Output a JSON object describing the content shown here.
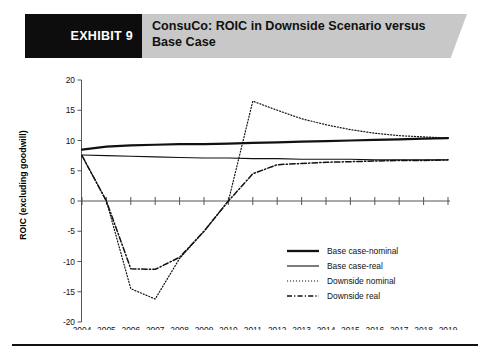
{
  "header": {
    "exhibit_label": "EXHIBIT 9",
    "title": "ConsuCo: ROIC in Downside Scenario versus Base Case",
    "banner_color": "#c8c8c8",
    "block_color": "#0d0d0d"
  },
  "legend": {
    "position": "inside-bottom-right",
    "items": [
      {
        "label": "Base case-nominal",
        "style": "solid-thick",
        "color": "#111111"
      },
      {
        "label": "Base case-real",
        "style": "solid-thin",
        "color": "#111111"
      },
      {
        "label": "Downside nominal",
        "style": "dotted",
        "color": "#111111"
      },
      {
        "label": "Downside real",
        "style": "dash-dot",
        "color": "#111111"
      }
    ]
  },
  "chart_data": {
    "type": "line",
    "title": "ConsuCo: ROIC in Downside Scenario versus Base Case",
    "xlabel": "",
    "ylabel": "ROIC (excluding goodwill)",
    "x": [
      2004,
      2005,
      2006,
      2007,
      2008,
      2009,
      2010,
      2011,
      2012,
      2013,
      2014,
      2015,
      2016,
      2017,
      2018,
      2019
    ],
    "xtick_labels": [
      "2004",
      "2005",
      "2006",
      "2007",
      "2008",
      "2009",
      "2010",
      "2011",
      "2012",
      "2013",
      "2014",
      "2015",
      "2016",
      "2017",
      "2018",
      "2019"
    ],
    "ytick_labels": [
      "-20",
      "-15",
      "-10",
      "-5",
      "0",
      "5",
      "10",
      "15",
      "20"
    ],
    "yticks": [
      -20,
      -15,
      -10,
      -5,
      0,
      5,
      10,
      15,
      20
    ],
    "ylim": [
      -20,
      20
    ],
    "grid": false,
    "series": [
      {
        "name": "Base case-nominal",
        "style": "solid-thick",
        "values": [
          8.5,
          9.0,
          9.2,
          9.3,
          9.4,
          9.4,
          9.5,
          9.6,
          9.7,
          9.8,
          9.9,
          10.0,
          10.1,
          10.2,
          10.3,
          10.4
        ]
      },
      {
        "name": "Base case-real",
        "style": "solid-thin",
        "values": [
          7.6,
          7.5,
          7.4,
          7.3,
          7.2,
          7.1,
          7.1,
          7.0,
          7.0,
          6.9,
          6.9,
          6.9,
          6.8,
          6.8,
          6.8,
          6.8
        ]
      },
      {
        "name": "Downside nominal",
        "style": "dotted",
        "values": [
          7.5,
          0.0,
          -14.5,
          -16.2,
          -9.5,
          -5.0,
          0.0,
          16.5,
          15.0,
          13.6,
          12.6,
          11.8,
          11.2,
          10.8,
          10.6,
          10.4
        ]
      },
      {
        "name": "Downside real",
        "style": "dash-dot",
        "values": [
          7.5,
          0.0,
          -11.2,
          -11.3,
          -9.3,
          -5.0,
          0.0,
          4.5,
          6.0,
          6.2,
          6.4,
          6.5,
          6.6,
          6.7,
          6.7,
          6.8
        ]
      }
    ]
  }
}
